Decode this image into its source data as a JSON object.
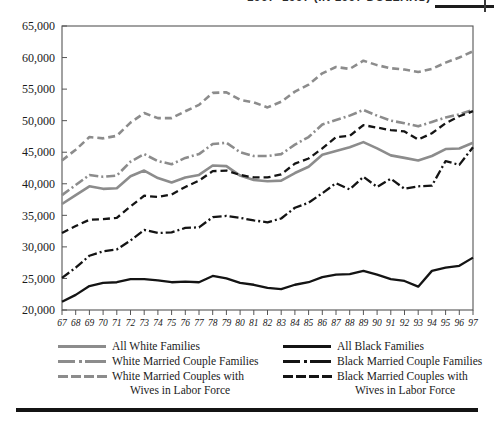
{
  "title": {
    "text": "1967–1997 (IN 1997 DOLLARS)"
  },
  "legend": {
    "white_column": [
      {
        "label": "All White Families",
        "style": "solid",
        "color": "#8c8c8c"
      },
      {
        "label": "White Married Couple Families",
        "style": "dashdot",
        "color": "#8c8c8c"
      },
      {
        "label": "White Married Couples with",
        "label2": "Wives in Labor Force",
        "style": "dashed",
        "color": "#8c8c8c"
      }
    ],
    "black_column": [
      {
        "label": "All Black Families",
        "style": "solid",
        "color": "#141414"
      },
      {
        "label": "Black Married Couple Families",
        "style": "dashdot",
        "color": "#141414"
      },
      {
        "label": "Black Married Couples with",
        "label2": "Wives in Labor Force",
        "style": "dashed",
        "color": "#141414"
      }
    ]
  },
  "chart_data": {
    "type": "line",
    "title": "1967–1997 (IN 1997 DOLLARS)",
    "xlabel": "",
    "ylabel": "",
    "xlim": [
      67,
      97
    ],
    "ylim": [
      20000,
      65000
    ],
    "ytick_step": 5000,
    "grid": false,
    "legend_position": "bottom",
    "x": [
      67,
      68,
      69,
      70,
      71,
      72,
      73,
      74,
      75,
      76,
      77,
      78,
      79,
      80,
      81,
      82,
      83,
      84,
      85,
      86,
      87,
      88,
      89,
      90,
      91,
      92,
      93,
      94,
      95,
      96,
      97
    ],
    "xticklabels": [
      "67",
      "68",
      "69",
      "70",
      "71",
      "72",
      "73",
      "74",
      "75",
      "76",
      "77",
      "78",
      "79",
      "80",
      "81",
      "82",
      "83",
      "84",
      "85",
      "86",
      "87",
      "88",
      "89",
      "90",
      "91",
      "92",
      "93",
      "94",
      "95",
      "96",
      "97"
    ],
    "yticklabels": [
      "20,000",
      "25,000",
      "30,000",
      "35,000",
      "40,000",
      "45,000",
      "50,000",
      "55,000",
      "60,000",
      "65,000"
    ],
    "series": [
      {
        "name": "All White Families",
        "style": "solid",
        "color": "#8c8c8c",
        "values": [
          36800,
          38200,
          39600,
          39200,
          39300,
          41200,
          42100,
          40900,
          40200,
          41000,
          41400,
          42900,
          42800,
          41300,
          40600,
          40400,
          40500,
          41700,
          42700,
          44600,
          45200,
          45800,
          46600,
          45600,
          44500,
          44100,
          43700,
          44400,
          45500,
          45600,
          46500
        ]
      },
      {
        "name": "White Married Couple Families",
        "style": "dashdot",
        "color": "#8c8c8c",
        "values": [
          38200,
          39800,
          41400,
          41100,
          41300,
          43500,
          44700,
          43600,
          43100,
          44100,
          44700,
          46300,
          46500,
          45000,
          44400,
          44400,
          44700,
          46200,
          47400,
          49400,
          50100,
          50800,
          51700,
          50800,
          50000,
          49600,
          49100,
          49800,
          50500,
          51000,
          51700
        ]
      },
      {
        "name": "White Married Couples with Wives in Labor Force",
        "style": "dashed",
        "color": "#8c8c8c",
        "values": [
          43700,
          45400,
          47400,
          47200,
          47600,
          49700,
          51200,
          50400,
          50400,
          51500,
          52500,
          54400,
          54500,
          53300,
          52900,
          52100,
          53000,
          54600,
          55700,
          57500,
          58500,
          58200,
          59500,
          58800,
          58300,
          58100,
          57700,
          58200,
          59200,
          60000,
          61000
        ]
      },
      {
        "name": "All Black Families",
        "style": "solid",
        "color": "#141414",
        "values": [
          21300,
          22400,
          23800,
          24300,
          24400,
          24900,
          24900,
          24700,
          24400,
          24500,
          24400,
          25400,
          25000,
          24300,
          24000,
          23500,
          23300,
          24000,
          24400,
          25200,
          25600,
          25700,
          26200,
          25600,
          24900,
          24600,
          23700,
          26200,
          26700,
          27000,
          28300
        ]
      },
      {
        "name": "Black Married Couple Families",
        "style": "dashdot",
        "color": "#141414",
        "values": [
          25100,
          26700,
          28600,
          29300,
          29600,
          31000,
          32700,
          32200,
          32300,
          33000,
          33100,
          34700,
          34900,
          34600,
          34200,
          33900,
          34500,
          36200,
          37000,
          38500,
          40100,
          39100,
          41100,
          39500,
          40800,
          39200,
          39600,
          39700,
          43600,
          43000,
          45800
        ]
      },
      {
        "name": "Black Married Couples with Wives in Labor Force",
        "style": "dashed",
        "color": "#141414",
        "values": [
          32200,
          33300,
          34300,
          34400,
          34600,
          36400,
          38100,
          37900,
          38300,
          39500,
          40500,
          42000,
          42100,
          41400,
          41000,
          41000,
          41500,
          43200,
          44000,
          45600,
          47400,
          47600,
          49300,
          48900,
          48500,
          48300,
          47000,
          48000,
          49600,
          50700,
          51500
        ]
      }
    ]
  }
}
